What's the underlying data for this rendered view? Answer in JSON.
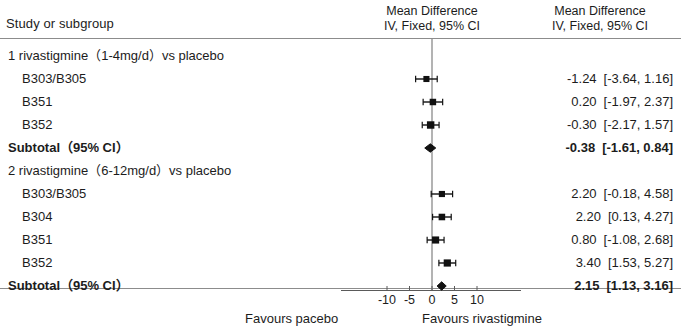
{
  "header": {
    "left_label": "Study or subgroup",
    "middle": {
      "line1": "Mean Difference",
      "line2": "IV, Fixed, 95% CI"
    },
    "right": {
      "line1": "Mean Difference",
      "line2": "IV, Fixed, 95% CI"
    }
  },
  "footer": {
    "favours_left": "Favours pacebo",
    "favours_right": "Favours rivastigmine"
  },
  "chart_data": {
    "type": "forest",
    "title": "Mean Difference IV, Fixed, 95% CI",
    "xlabel": "Mean Difference",
    "xlim": [
      -13,
      13
    ],
    "ticks": [
      -10,
      -5,
      0,
      5,
      10
    ],
    "tick_labels": [
      "-10",
      "-5",
      "0",
      "5",
      "10"
    ],
    "null_value": 0,
    "grid": false,
    "effect_measure": "Mean Difference",
    "model": "IV, Fixed, 95% CI",
    "favours_left": "Favours pacebo",
    "favours_right": "Favours rivastigmine",
    "groups": [
      {
        "label": "1 rivastigmine（1-4mg/d）vs placebo",
        "rows": [
          {
            "label": "B303/B305",
            "estimate": -1.24,
            "ci_low": -3.64,
            "ci_high": 1.16,
            "est_text": "-1.24",
            "ci_text": "[-3.64, 1.16]",
            "weight": 0.26,
            "type": "study"
          },
          {
            "label": "B351",
            "estimate": 0.2,
            "ci_low": -1.97,
            "ci_high": 2.37,
            "est_text": "0.20",
            "ci_text": "[-1.97, 2.37]",
            "weight": 0.31,
            "type": "study"
          },
          {
            "label": "B352",
            "estimate": -0.3,
            "ci_low": -2.17,
            "ci_high": 1.57,
            "est_text": "-0.30",
            "ci_text": "[-2.17, 1.57]",
            "weight": 0.43,
            "type": "study"
          },
          {
            "label": "Subtotal（95% CI）",
            "estimate": -0.38,
            "ci_low": -1.61,
            "ci_high": 0.84,
            "est_text": "-0.38",
            "ci_text": "[-1.61, 0.84]",
            "type": "subtotal"
          }
        ]
      },
      {
        "label": "2 rivastigmine（6-12mg/d）vs placebo",
        "rows": [
          {
            "label": "B303/B305",
            "estimate": 2.2,
            "ci_low": -0.18,
            "ci_high": 4.58,
            "est_text": "2.20",
            "ci_text": "[-0.18, 4.58]",
            "weight": 0.27,
            "type": "study"
          },
          {
            "label": "B304",
            "estimate": 2.2,
            "ci_low": 0.13,
            "ci_high": 4.27,
            "est_text": "2.20",
            "ci_text": "[0.13, 4.27]",
            "weight": 0.32,
            "type": "study"
          },
          {
            "label": "B351",
            "estimate": 0.8,
            "ci_low": -1.08,
            "ci_high": 2.68,
            "est_text": "0.80",
            "ci_text": "[-1.08, 2.68]",
            "weight": 0.39,
            "type": "study"
          },
          {
            "label": "B352",
            "estimate": 3.4,
            "ci_low": 1.53,
            "ci_high": 5.27,
            "est_text": "3.40",
            "ci_text": "[1.53, 5.27]",
            "weight": 0.4,
            "type": "study"
          },
          {
            "label": "Subtotal（95% CI）",
            "estimate": 2.15,
            "ci_low": 1.13,
            "ci_high": 3.16,
            "est_text": "2.15",
            "ci_text": "[1.13, 3.16]",
            "type": "subtotal"
          }
        ]
      }
    ]
  }
}
